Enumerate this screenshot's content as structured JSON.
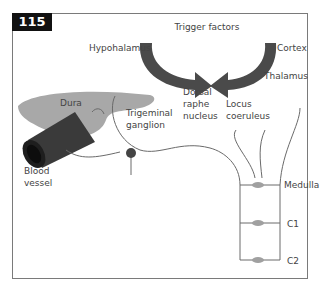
{
  "figure": {
    "number": "115",
    "title": "Trigger factors",
    "labels": {
      "hypothalamus": "Hypohalamus",
      "cortex": "Cortex",
      "thalamus": "Thalamus",
      "dorsal_raphe_1": "Dorsal",
      "dorsal_raphe_2": "raphe",
      "dorsal_raphe_3": "nucleus",
      "locus_1": "Locus",
      "locus_2": "coeruleus",
      "dura": "Dura",
      "trigeminal_1": "Trigeminal",
      "trigeminal_2": "ganglion",
      "blood_1": "Blood",
      "blood_2": "vessel",
      "medulla": "Medulla",
      "c1": "C1",
      "c2": "C2"
    },
    "colors": {
      "arrow": "#4a4a4a",
      "dura": "#a8a8a8",
      "vessel": "#3a3a3a",
      "nerve": "#6a6a6a",
      "neuron": "#a0a0a0"
    }
  }
}
